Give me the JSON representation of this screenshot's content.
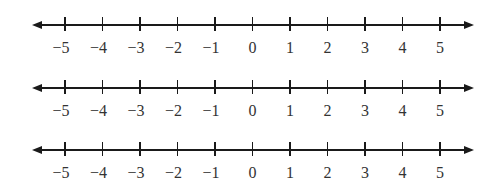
{
  "number_lines": [
    {
      "id": "line-1",
      "ticks": [
        "−5",
        "−4",
        "−3",
        "−2",
        "−1",
        "0",
        "1",
        "2",
        "3",
        "4",
        "5"
      ]
    },
    {
      "id": "line-2",
      "ticks": [
        "−5",
        "−4",
        "−3",
        "−2",
        "−1",
        "0",
        "1",
        "2",
        "3",
        "4",
        "5"
      ]
    },
    {
      "id": "line-3",
      "ticks": [
        "−5",
        "−4",
        "−3",
        "−2",
        "−1",
        "0",
        "1",
        "2",
        "3",
        "4",
        "5"
      ]
    }
  ],
  "range": {
    "min": -5,
    "max": 5,
    "step": 1
  },
  "colors": {
    "line": "#1a1a1a",
    "label": "#333333",
    "background": "#ffffff"
  }
}
